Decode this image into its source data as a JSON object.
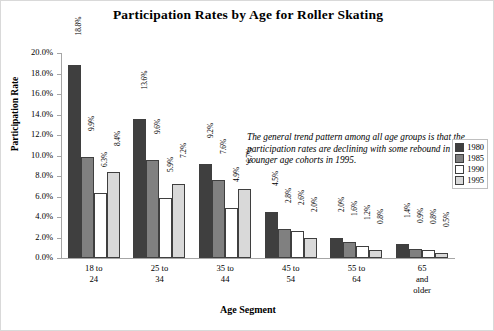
{
  "chart_data": {
    "type": "bar",
    "title": "Participation Rates by Age for Roller Skating",
    "xlabel": "Age Segment",
    "ylabel": "Participation Rate",
    "categories": [
      "18 to 24",
      "25 to 34",
      "35 to 44",
      "45 to 54",
      "55 to 64",
      "65 and older"
    ],
    "category_lines": [
      [
        "18 to",
        "24"
      ],
      [
        "25 to",
        "34"
      ],
      [
        "35 to",
        "44"
      ],
      [
        "45 to",
        "54"
      ],
      [
        "55 to",
        "64"
      ],
      [
        "65",
        "and",
        "older"
      ]
    ],
    "series": [
      {
        "name": "1980",
        "color": "#3f3f3f",
        "values": [
          18.8,
          13.6,
          9.2,
          4.5,
          2.0,
          1.4
        ],
        "labels": [
          "18.8%",
          "13.6%",
          "9.2%",
          "4.5%",
          "2.0%",
          "1.4%"
        ]
      },
      {
        "name": "1985",
        "color": "#808080",
        "values": [
          9.9,
          9.6,
          7.6,
          2.8,
          1.6,
          0.9
        ],
        "labels": [
          "9.9%",
          "9.6%",
          "7.6%",
          "2.8%",
          "1.6%",
          "0.9%"
        ]
      },
      {
        "name": "1990",
        "color": "#ffffff",
        "values": [
          6.3,
          5.9,
          4.9,
          2.6,
          1.2,
          0.8
        ],
        "labels": [
          "6.3%",
          "5.9%",
          "4.9%",
          "2.6%",
          "1.2%",
          "0.8%"
        ]
      },
      {
        "name": "1995",
        "color": "#d9d9d9",
        "values": [
          8.4,
          7.2,
          6.7,
          2.0,
          0.8,
          0.5
        ],
        "labels": [
          "8.4%",
          "7.2%",
          "6.7%",
          "2.0%",
          "0.8%",
          "0.5%"
        ]
      }
    ],
    "ylim": [
      0,
      20
    ],
    "ytick_labels": [
      "20.0%",
      "18.0%",
      "16.0%",
      "14.0%",
      "12.0%",
      "10.0%",
      "8.0%",
      "6.0%",
      "4.0%",
      "2.0%",
      "0.0%"
    ],
    "ytick_values": [
      20,
      18,
      16,
      14,
      12,
      10,
      8,
      6,
      4,
      2,
      0
    ],
    "grid": false,
    "legend_position": "right",
    "annotation": "The general trend pattern among all age groups is that the participation rates are declining with some rebound in the younger age cohorts in 1995.",
    "units": "percent"
  }
}
